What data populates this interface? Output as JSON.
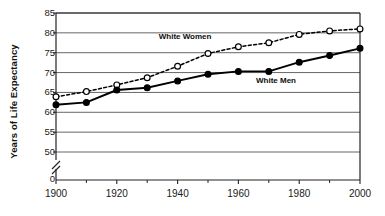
{
  "chart_data": {
    "type": "line",
    "title": "",
    "xlabel": "",
    "ylabel": "Years of Life Expectancy",
    "x": [
      1900,
      1910,
      1920,
      1930,
      1940,
      1950,
      1960,
      1970,
      1980,
      1990,
      2000
    ],
    "xlim": [
      1900,
      2000
    ],
    "ylim": [
      48,
      85
    ],
    "y_axis_break": true,
    "y_zero_label": "0",
    "grid": true,
    "grid_axis": "y",
    "legend_position": "inline-annotation",
    "x_tick_labels": [
      "1900",
      "1920",
      "1940",
      "1960",
      "1980",
      "2000"
    ],
    "x_tick_values": [
      1900,
      1920,
      1940,
      1960,
      1980,
      2000
    ],
    "x_minor_tick_values": [
      1910,
      1930,
      1950,
      1970,
      1990
    ],
    "y_tick_labels": [
      "50",
      "55",
      "60",
      "65",
      "70",
      "75",
      "80",
      "85"
    ],
    "y_tick_values": [
      50,
      55,
      60,
      65,
      70,
      75,
      80,
      85
    ],
    "series": [
      {
        "name": "White Women",
        "label": "White Women",
        "marker": "open-circle",
        "line_style": "dashed",
        "color": "#000000",
        "values": [
          63.9,
          65.2,
          66.9,
          68.7,
          71.6,
          74.8,
          76.5,
          77.5,
          79.6,
          80.5,
          81.0
        ]
      },
      {
        "name": "White Men",
        "label": "White Men",
        "marker": "filled-circle",
        "line_style": "solid",
        "color": "#000000",
        "values": [
          61.9,
          62.5,
          65.6,
          66.2,
          67.9,
          69.6,
          70.3,
          70.3,
          72.6,
          74.3,
          76.1
        ]
      }
    ],
    "annotations": [
      {
        "text": "White Women",
        "x": 1943,
        "y": 79.0
      },
      {
        "text": "White Men",
        "x": 1975,
        "y": 67.8
      }
    ]
  }
}
